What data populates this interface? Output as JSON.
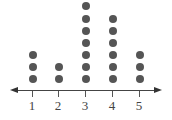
{
  "chart_data": {
    "type": "scatter",
    "subtype": "dot_plot",
    "title": "",
    "xlabel": "",
    "ylabel": "",
    "categories": [
      "1",
      "2",
      "3",
      "4",
      "5"
    ],
    "values": [
      3,
      2,
      7,
      6,
      3
    ],
    "xlim": [
      1,
      5
    ],
    "grid": false,
    "legend": null,
    "colors": {
      "dot": "#555555",
      "axis": "#444444"
    }
  },
  "axis": {
    "ticks": [
      {
        "label": "1",
        "x": 32
      },
      {
        "label": "2",
        "x": 58
      },
      {
        "label": "3",
        "x": 85
      },
      {
        "label": "4",
        "x": 112
      },
      {
        "label": "5",
        "x": 139
      }
    ]
  }
}
